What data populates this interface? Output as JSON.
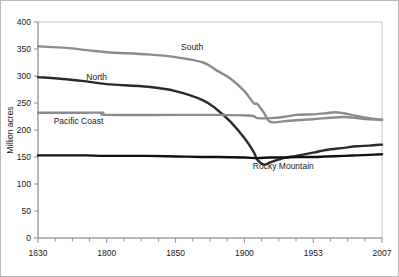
{
  "chart_data": {
    "type": "line",
    "title": "",
    "xlabel": "",
    "ylabel": "Million acres",
    "ylim": [
      0,
      400
    ],
    "ytick_values": [
      0,
      50,
      100,
      150,
      200,
      250,
      300,
      350,
      400
    ],
    "ytick_labels": [
      "0",
      "50",
      "100",
      "150",
      "200",
      "250",
      "300",
      "350",
      "400"
    ],
    "xlim": [
      1630,
      2007
    ],
    "xtick_labels": [
      "1630",
      "1800",
      "1850",
      "1900",
      "1953",
      "2007"
    ],
    "xtick_values": [
      1630,
      1800,
      1850,
      1900,
      1953,
      2007
    ],
    "minor_ticks": true,
    "grid": false,
    "legend": "inline-labels",
    "series": [
      {
        "name": "South",
        "color": "#8c8c8c",
        "label_x": 1862,
        "label_y": 348,
        "x": [
          1630,
          1700,
          1750,
          1800,
          1830,
          1850,
          1870,
          1880,
          1890,
          1900,
          1907,
          1910,
          1915,
          1920,
          1930,
          1940,
          1953,
          1963,
          1977,
          1987,
          1997,
          2007
        ],
        "y": [
          355,
          352,
          348,
          344,
          340,
          335,
          325,
          310,
          295,
          272,
          250,
          248,
          232,
          215,
          216,
          218,
          220,
          222,
          224,
          222,
          220,
          219
        ]
      },
      {
        "name": "North",
        "color": "#2b2b2b",
        "label_x": 1775,
        "label_y": 292,
        "x": [
          1630,
          1700,
          1750,
          1800,
          1830,
          1850,
          1870,
          1880,
          1890,
          1900,
          1907,
          1910,
          1915,
          1920,
          1930,
          1940,
          1953,
          1963,
          1977,
          1987,
          1997,
          2007
        ],
        "y": [
          298,
          294,
          290,
          285,
          280,
          272,
          255,
          238,
          215,
          185,
          160,
          145,
          136,
          140,
          148,
          152,
          158,
          163,
          167,
          170,
          171,
          173
        ]
      },
      {
        "name": "Pacific Coast",
        "color": "#8c8c8c",
        "label_x": 1730,
        "label_y": 211,
        "x": [
          1630,
          1700,
          1750,
          1790,
          1800,
          1850,
          1880,
          1900,
          1907,
          1910,
          1920,
          1930,
          1940,
          1953,
          1963,
          1970,
          1977,
          1987,
          1997,
          2007
        ],
        "y": [
          232,
          232,
          232,
          232,
          228,
          228,
          228,
          227,
          226,
          222,
          222,
          224,
          228,
          229,
          231,
          233,
          231,
          226,
          222,
          219
        ]
      },
      {
        "name": "Rocky Mountain",
        "color": "#111111",
        "label_x": 1930,
        "label_y": 128,
        "x": [
          1630,
          1700,
          1750,
          1800,
          1830,
          1850,
          1870,
          1880,
          1900,
          1910,
          1920,
          1930,
          1940,
          1953,
          1963,
          1977,
          1987,
          1997,
          2007
        ],
        "y": [
          153,
          153,
          153,
          152,
          152,
          151,
          150,
          150,
          149,
          148,
          149,
          149,
          150,
          150,
          151,
          152,
          153,
          154,
          155
        ]
      }
    ]
  }
}
